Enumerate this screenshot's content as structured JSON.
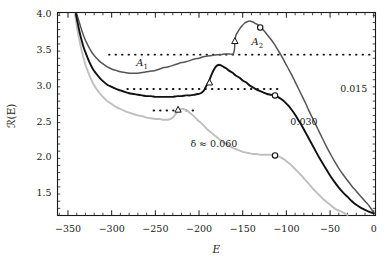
{
  "figure": {
    "background": "#ffffff",
    "frame_color": "#1a1a1a"
  },
  "chart_data": {
    "type": "line",
    "title": "",
    "subtitle": "",
    "xlabel": "E",
    "ylabel": "ℛ(E)",
    "xlim": [
      -362,
      2
    ],
    "ylim": [
      1.18,
      4.02
    ],
    "grid": false,
    "legend_position": "inline-annotations",
    "x_ticks": [
      -350,
      -300,
      -250,
      -200,
      -150,
      -100,
      -50,
      0
    ],
    "x_tick_labels": [
      "−350",
      "−300",
      "−250",
      "−200",
      "−150",
      "−100",
      "−50",
      "0"
    ],
    "x_minor_tick_step": 10,
    "y_ticks": [
      1.5,
      2.0,
      2.5,
      3.0,
      3.5,
      4.0
    ],
    "y_tick_labels": [
      "1.5",
      "2.0",
      "2.5",
      "3.0",
      "3.5",
      "4.0"
    ],
    "y_minor_tick_step": 0.1,
    "series": [
      {
        "name": "0.015",
        "label": "0.015",
        "color": "#555555",
        "linewidth": 1.5,
        "points": [
          [
            -340.0,
            4.0
          ],
          [
            -338.0,
            3.92
          ],
          [
            -336.0,
            3.84
          ],
          [
            -334.0,
            3.76
          ],
          [
            -331.0,
            3.66
          ],
          [
            -328.0,
            3.58
          ],
          [
            -325.0,
            3.51
          ],
          [
            -322.0,
            3.45
          ],
          [
            -318.0,
            3.39
          ],
          [
            -314.0,
            3.34
          ],
          [
            -310.0,
            3.3
          ],
          [
            -305.0,
            3.26
          ],
          [
            -300.0,
            3.23
          ],
          [
            -295.0,
            3.21
          ],
          [
            -290.0,
            3.19
          ],
          [
            -285.0,
            3.18
          ],
          [
            -280.0,
            3.17
          ],
          [
            -275.0,
            3.17
          ],
          [
            -270.0,
            3.17
          ],
          [
            -265.0,
            3.18
          ],
          [
            -260.0,
            3.19
          ],
          [
            -255.0,
            3.2
          ],
          [
            -250.0,
            3.21
          ],
          [
            -245.0,
            3.23
          ],
          [
            -240.0,
            3.25
          ],
          [
            -235.0,
            3.26
          ],
          [
            -230.0,
            3.28
          ],
          [
            -225.0,
            3.3
          ],
          [
            -220.0,
            3.32
          ],
          [
            -215.0,
            3.33
          ],
          [
            -210.0,
            3.35
          ],
          [
            -205.0,
            3.37
          ],
          [
            -200.0,
            3.38
          ],
          [
            -195.0,
            3.4
          ],
          [
            -190.0,
            3.41
          ],
          [
            -185.0,
            3.42
          ],
          [
            -180.0,
            3.43
          ],
          [
            -175.0,
            3.43
          ],
          [
            -170.0,
            3.44
          ],
          [
            -165.0,
            3.44
          ],
          [
            -161.0,
            3.44
          ],
          [
            -159.5,
            3.5
          ],
          [
            -159.0,
            3.59
          ],
          [
            -158.5,
            3.66
          ],
          [
            -157.5,
            3.71
          ],
          [
            -156.0,
            3.74
          ],
          [
            -154.0,
            3.78
          ],
          [
            -151.0,
            3.83
          ],
          [
            -148.0,
            3.87
          ],
          [
            -145.0,
            3.89
          ],
          [
            -142.0,
            3.9
          ],
          [
            -139.0,
            3.89
          ],
          [
            -136.0,
            3.87
          ],
          [
            -133.0,
            3.85
          ],
          [
            -130.0,
            3.81
          ],
          [
            -126.0,
            3.77
          ],
          [
            -122.0,
            3.71
          ],
          [
            -118.0,
            3.65
          ],
          [
            -114.0,
            3.58
          ],
          [
            -110.0,
            3.5
          ],
          [
            -106.0,
            3.42
          ],
          [
            -102.0,
            3.33
          ],
          [
            -98.0,
            3.24
          ],
          [
            -94.0,
            3.15
          ],
          [
            -90.0,
            3.05
          ],
          [
            -86.0,
            2.95
          ],
          [
            -82.0,
            2.85
          ],
          [
            -78.0,
            2.75
          ],
          [
            -74.0,
            2.64
          ],
          [
            -70.0,
            2.54
          ],
          [
            -66.0,
            2.44
          ],
          [
            -62.0,
            2.34
          ],
          [
            -58.0,
            2.24
          ],
          [
            -54.0,
            2.14
          ],
          [
            -50.0,
            2.05
          ],
          [
            -45.0,
            1.94
          ],
          [
            -40.0,
            1.84
          ],
          [
            -35.0,
            1.75
          ],
          [
            -30.0,
            1.67
          ],
          [
            -25.0,
            1.59
          ],
          [
            -20.0,
            1.52
          ],
          [
            -15.0,
            1.45
          ],
          [
            -10.0,
            1.38
          ],
          [
            -5.0,
            1.31
          ],
          [
            0.0,
            1.22
          ]
        ],
        "markers": [
          {
            "shape": "triangle",
            "x": -159.0,
            "y": 3.62
          },
          {
            "shape": "circle",
            "x": -130.0,
            "y": 3.81
          }
        ]
      },
      {
        "name": "0.030",
        "label": "0.030",
        "color": "#111111",
        "linewidth": 1.9,
        "points": [
          [
            -341.0,
            4.0
          ],
          [
            -339.0,
            3.88
          ],
          [
            -337.0,
            3.76
          ],
          [
            -335.0,
            3.66
          ],
          [
            -332.0,
            3.53
          ],
          [
            -329.0,
            3.43
          ],
          [
            -326.0,
            3.34
          ],
          [
            -322.0,
            3.24
          ],
          [
            -318.0,
            3.17
          ],
          [
            -314.0,
            3.11
          ],
          [
            -310.0,
            3.06
          ],
          [
            -305.0,
            3.01
          ],
          [
            -300.0,
            2.98
          ],
          [
            -295.0,
            2.95
          ],
          [
            -290.0,
            2.93
          ],
          [
            -285.0,
            2.91
          ],
          [
            -280.0,
            2.89
          ],
          [
            -275.0,
            2.88
          ],
          [
            -270.0,
            2.87
          ],
          [
            -265.0,
            2.86
          ],
          [
            -260.0,
            2.85
          ],
          [
            -255.0,
            2.85
          ],
          [
            -250.0,
            2.84
          ],
          [
            -245.0,
            2.84
          ],
          [
            -240.0,
            2.84
          ],
          [
            -235.0,
            2.84
          ],
          [
            -230.0,
            2.84
          ],
          [
            -225.0,
            2.85
          ],
          [
            -220.0,
            2.85
          ],
          [
            -215.0,
            2.86
          ],
          [
            -210.0,
            2.86
          ],
          [
            -205.0,
            2.87
          ],
          [
            -201.0,
            2.88
          ],
          [
            -198.0,
            2.89
          ],
          [
            -195.0,
            2.92
          ],
          [
            -193.0,
            2.96
          ],
          [
            -191.0,
            3.01
          ],
          [
            -189.0,
            3.05
          ],
          [
            -187.0,
            3.11
          ],
          [
            -185.0,
            3.17
          ],
          [
            -183.0,
            3.22
          ],
          [
            -181.0,
            3.26
          ],
          [
            -179.0,
            3.28
          ],
          [
            -177.0,
            3.29
          ],
          [
            -175.0,
            3.28
          ],
          [
            -172.0,
            3.26
          ],
          [
            -169.0,
            3.24
          ],
          [
            -166.0,
            3.21
          ],
          [
            -162.0,
            3.18
          ],
          [
            -158.0,
            3.14
          ],
          [
            -154.0,
            3.11
          ],
          [
            -150.0,
            3.07
          ],
          [
            -146.0,
            3.04
          ],
          [
            -142.0,
            3.0
          ],
          [
            -138.0,
            2.97
          ],
          [
            -134.0,
            2.94
          ],
          [
            -130.0,
            2.92
          ],
          [
            -126.0,
            2.9
          ],
          [
            -122.0,
            2.88
          ],
          [
            -118.0,
            2.87
          ],
          [
            -114.0,
            2.86
          ],
          [
            -110.0,
            2.84
          ],
          [
            -106.0,
            2.81
          ],
          [
            -102.0,
            2.77
          ],
          [
            -98.0,
            2.72
          ],
          [
            -94.0,
            2.66
          ],
          [
            -90.0,
            2.59
          ],
          [
            -86.0,
            2.51
          ],
          [
            -82.0,
            2.43
          ],
          [
            -78.0,
            2.34
          ],
          [
            -74.0,
            2.25
          ],
          [
            -70.0,
            2.16
          ],
          [
            -66.0,
            2.07
          ],
          [
            -62.0,
            1.98
          ],
          [
            -58.0,
            1.9
          ],
          [
            -54.0,
            1.82
          ],
          [
            -50.0,
            1.74
          ],
          [
            -45.0,
            1.65
          ],
          [
            -40.0,
            1.57
          ],
          [
            -35.0,
            1.5
          ],
          [
            -30.0,
            1.44
          ],
          [
            -25.0,
            1.38
          ],
          [
            -20.0,
            1.33
          ],
          [
            -15.0,
            1.29
          ],
          [
            -10.0,
            1.26
          ],
          [
            -5.0,
            1.23
          ],
          [
            0.0,
            1.21
          ]
        ],
        "markers": [
          {
            "shape": "triangle",
            "x": -188.0,
            "y": 3.04
          },
          {
            "shape": "circle",
            "x": -113.0,
            "y": 2.86
          }
        ]
      },
      {
        "name": "0.060",
        "label": "δ ≈ 0.060",
        "color": "#bfbfbf",
        "linewidth": 1.9,
        "points": [
          [
            -342.0,
            4.0
          ],
          [
            -340.0,
            3.84
          ],
          [
            -338.0,
            3.7
          ],
          [
            -336.0,
            3.58
          ],
          [
            -333.0,
            3.42
          ],
          [
            -330.0,
            3.29
          ],
          [
            -327.0,
            3.19
          ],
          [
            -323.0,
            3.07
          ],
          [
            -319.0,
            2.98
          ],
          [
            -315.0,
            2.91
          ],
          [
            -310.0,
            2.84
          ],
          [
            -305.0,
            2.78
          ],
          [
            -300.0,
            2.74
          ],
          [
            -295.0,
            2.7
          ],
          [
            -290.0,
            2.67
          ],
          [
            -285.0,
            2.64
          ],
          [
            -280.0,
            2.62
          ],
          [
            -275.0,
            2.6
          ],
          [
            -270.0,
            2.58
          ],
          [
            -265.0,
            2.57
          ],
          [
            -260.0,
            2.55
          ],
          [
            -255.0,
            2.54
          ],
          [
            -250.0,
            2.53
          ],
          [
            -245.0,
            2.53
          ],
          [
            -242.0,
            2.52
          ],
          [
            -239.0,
            2.52
          ],
          [
            -236.0,
            2.52
          ],
          [
            -233.0,
            2.53
          ],
          [
            -230.0,
            2.55
          ],
          [
            -228.0,
            2.58
          ],
          [
            -226.0,
            2.61
          ],
          [
            -224.0,
            2.64
          ],
          [
            -222.0,
            2.66
          ],
          [
            -220.0,
            2.67
          ],
          [
            -218.0,
            2.67
          ],
          [
            -216.0,
            2.66
          ],
          [
            -213.0,
            2.64
          ],
          [
            -210.0,
            2.61
          ],
          [
            -206.0,
            2.57
          ],
          [
            -202.0,
            2.52
          ],
          [
            -198.0,
            2.48
          ],
          [
            -194.0,
            2.43
          ],
          [
            -190.0,
            2.38
          ],
          [
            -186.0,
            2.34
          ],
          [
            -182.0,
            2.3
          ],
          [
            -178.0,
            2.26
          ],
          [
            -174.0,
            2.22
          ],
          [
            -170.0,
            2.19
          ],
          [
            -166.0,
            2.16
          ],
          [
            -162.0,
            2.13
          ],
          [
            -158.0,
            2.11
          ],
          [
            -154.0,
            2.09
          ],
          [
            -150.0,
            2.07
          ],
          [
            -146.0,
            2.06
          ],
          [
            -142.0,
            2.05
          ],
          [
            -138.0,
            2.04
          ],
          [
            -134.0,
            2.04
          ],
          [
            -130.0,
            2.03
          ],
          [
            -126.0,
            2.03
          ],
          [
            -122.0,
            2.03
          ],
          [
            -118.0,
            2.03
          ],
          [
            -114.0,
            2.02
          ],
          [
            -110.0,
            2.01
          ],
          [
            -106.0,
            1.99
          ],
          [
            -102.0,
            1.96
          ],
          [
            -98.0,
            1.92
          ],
          [
            -94.0,
            1.88
          ],
          [
            -90.0,
            1.83
          ],
          [
            -86.0,
            1.78
          ],
          [
            -82.0,
            1.73
          ],
          [
            -78.0,
            1.67
          ],
          [
            -74.0,
            1.62
          ],
          [
            -70.0,
            1.56
          ],
          [
            -66.0,
            1.51
          ],
          [
            -62.0,
            1.46
          ],
          [
            -58.0,
            1.41
          ],
          [
            -54.0,
            1.37
          ],
          [
            -50.0,
            1.33
          ],
          [
            -46.0,
            1.29
          ],
          [
            -42.0,
            1.26
          ],
          [
            -38.0,
            1.24
          ],
          [
            -35.0,
            1.22
          ],
          [
            -32.0,
            1.2
          ],
          [
            -30.0,
            1.19
          ]
        ],
        "markers": [
          {
            "shape": "triangle",
            "x": -224.0,
            "y": 2.66
          },
          {
            "shape": "circle",
            "x": -113.0,
            "y": 2.02
          }
        ]
      }
    ],
    "reference_lines": [
      {
        "name": "A1-upper-plateau",
        "y": 3.43,
        "x_start": -303,
        "x_end": 0,
        "style": "dotted",
        "color": "#111111"
      },
      {
        "name": "A1-mid-plateau",
        "y": 2.95,
        "x_start": -282,
        "x_end": -106,
        "style": "dotted",
        "color": "#111111"
      },
      {
        "name": "A1-lower-plateau",
        "y": 2.65,
        "x_start": -252,
        "x_end": -200,
        "style": "dotted",
        "color": "#111111"
      }
    ],
    "annotations": [
      {
        "name": "region-A1",
        "text": "A₁",
        "x": -265,
        "y": 3.3
      },
      {
        "name": "region-A2",
        "text": "A₂",
        "x": -133,
        "y": 3.6
      },
      {
        "name": "curve-label-0015",
        "text": "0.015",
        "x": -23,
        "y": 2.95
      },
      {
        "name": "curve-label-0030",
        "text": "0.030",
        "x": -80,
        "y": 2.5
      },
      {
        "name": "curve-label-delta",
        "text": "δ ≈ 0.060",
        "x": -183,
        "y": 2.19
      }
    ]
  },
  "axes": {
    "x_title": "E",
    "y_title": "ℛ(E)",
    "x_tick_labels": [
      "−350",
      "−300",
      "−250",
      "−200",
      "−150",
      "−100",
      "−50",
      "0"
    ],
    "y_tick_labels": [
      "1.5",
      "2.0",
      "2.5",
      "3.0",
      "3.5",
      "4.0"
    ]
  },
  "annotation_text": {
    "a1": "A",
    "a1_sub": "1",
    "a2": "A",
    "a2_sub": "2",
    "label_0015": "0.015",
    "label_0030": "0.030",
    "label_delta": "δ ≈ 0.060"
  }
}
